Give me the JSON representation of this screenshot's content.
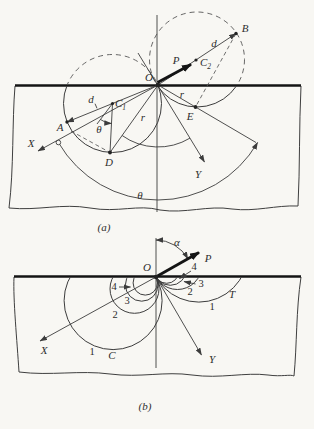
{
  "colors": {
    "ink": "#3c3c3c",
    "heavy_ink": "#141414",
    "paper": "#f8f7f3"
  },
  "figure_a": {
    "caption": "(a)",
    "labels": {
      "origin": "O",
      "force": "P",
      "center1_main": "C",
      "center1_sub": "1",
      "center2_main": "C",
      "center2_sub": "2",
      "point_a": "A",
      "point_b": "B",
      "point_d": "D",
      "point_e": "E",
      "axis_x": "X",
      "axis_y": "Y",
      "diameter_left": "d",
      "diameter_right": "d",
      "radius_left": "r",
      "radius_right": "r",
      "angle_at_center": "θ",
      "angle_sweep": "θ"
    }
  },
  "figure_b": {
    "caption": "(b)",
    "labels": {
      "origin": "O",
      "force": "P",
      "angle": "α",
      "axis_x": "X",
      "axis_y": "Y",
      "compression_family": "C",
      "tension_family": "T"
    },
    "isobars_left": [
      "1",
      "2",
      "3",
      "4"
    ],
    "isobars_right": [
      "1",
      "2",
      "3",
      "4"
    ]
  }
}
